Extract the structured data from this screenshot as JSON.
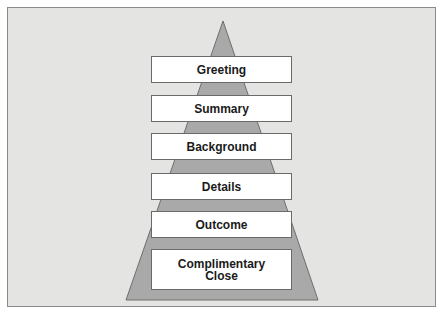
{
  "diagram": {
    "type": "pyramid",
    "colors": {
      "background": "#e4e4e2",
      "pyramid_fill": "#a9a9a9",
      "box_fill": "#ffffff",
      "box_border": "#6a6a6a",
      "text": "#1a1a1a"
    },
    "levels": [
      {
        "label": "Greeting"
      },
      {
        "label": "Summary"
      },
      {
        "label": "Background"
      },
      {
        "label": "Details"
      },
      {
        "label": "Outcome"
      },
      {
        "label": "Complimentary Close"
      }
    ]
  }
}
